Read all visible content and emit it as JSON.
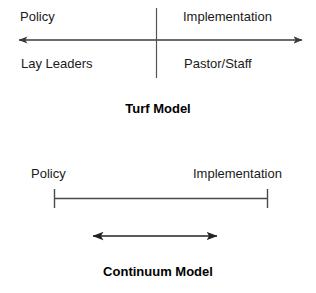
{
  "figure": {
    "background_color": "#ffffff",
    "line_color": "#3a3a3a",
    "text_color": "#1a1a1a"
  },
  "turf_model": {
    "caption": "Turf Model",
    "top_left_label": "Policy",
    "top_right_label": "Implementation",
    "bottom_left_label": "Lay Leaders",
    "bottom_right_label": "Pastor/Staff",
    "axis": {
      "type": "double-headed-horizontal-arrow",
      "x_start": 18,
      "x_end": 303,
      "y": 40
    },
    "divider": {
      "type": "vertical-line",
      "x": 156,
      "y_start": 8,
      "y_end": 78
    }
  },
  "continuum_model": {
    "caption": "Continuum Model",
    "left_label": "Policy",
    "right_label": "Implementation",
    "span_bracket": {
      "type": "horizontal-line-with-end-ticks",
      "x_start": 54,
      "x_end": 268,
      "y": 198,
      "tick_half_height": 9
    },
    "range_arrow": {
      "type": "double-headed-horizontal-arrow",
      "x_start": 92,
      "x_end": 218,
      "y": 236
    }
  }
}
